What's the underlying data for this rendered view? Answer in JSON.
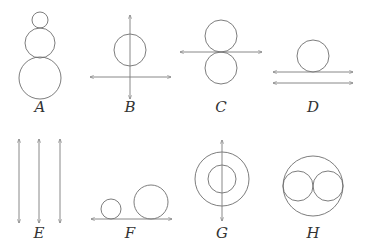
{
  "figures": [
    {
      "id": "A",
      "label": "A",
      "description": "three stacked tangent circles, increasing size downward",
      "circles": [
        {
          "cx": 40,
          "cy": 20,
          "r": 8
        },
        {
          "cx": 40,
          "cy": 43,
          "r": 15
        },
        {
          "cx": 40,
          "cy": 78,
          "r": 21
        }
      ],
      "lines": [],
      "label_pos": {
        "x": 40,
        "y": 112
      }
    },
    {
      "id": "B",
      "label": "B",
      "description": "circle pierced by vertical line, with horizontal line below",
      "circles": [
        {
          "cx": 130,
          "cy": 50,
          "r": 16
        }
      ],
      "lines": [
        {
          "x1": 130,
          "y1": 15,
          "x2": 130,
          "y2": 99
        },
        {
          "x1": 90,
          "y1": 77,
          "x2": 171,
          "y2": 77
        }
      ],
      "label_pos": {
        "x": 130,
        "y": 112
      }
    },
    {
      "id": "C",
      "label": "C",
      "description": "two equal circles tangent at a horizontal line",
      "circles": [
        {
          "cx": 221,
          "cy": 36,
          "r": 16
        },
        {
          "cx": 221,
          "cy": 68,
          "r": 16
        }
      ],
      "lines": [
        {
          "x1": 180,
          "y1": 52,
          "x2": 262,
          "y2": 52
        }
      ],
      "label_pos": {
        "x": 221,
        "y": 112
      }
    },
    {
      "id": "D",
      "label": "D",
      "description": "circle resting on one of two parallel horizontal lines",
      "circles": [
        {
          "cx": 313,
          "cy": 56,
          "r": 16
        }
      ],
      "lines": [
        {
          "x1": 273,
          "y1": 72,
          "x2": 353,
          "y2": 72
        },
        {
          "x1": 273,
          "y1": 83,
          "x2": 353,
          "y2": 83
        }
      ],
      "label_pos": {
        "x": 313,
        "y": 112
      }
    },
    {
      "id": "E",
      "label": "E",
      "description": "three parallel vertical lines",
      "circles": [],
      "lines": [
        {
          "x1": 19,
          "y1": 139,
          "x2": 19,
          "y2": 223
        },
        {
          "x1": 39,
          "y1": 139,
          "x2": 39,
          "y2": 223
        },
        {
          "x1": 60,
          "y1": 139,
          "x2": 60,
          "y2": 223
        }
      ],
      "label_pos": {
        "x": 39,
        "y": 238
      }
    },
    {
      "id": "F",
      "label": "F",
      "description": "small and large circles resting on a horizontal line",
      "circles": [
        {
          "cx": 111,
          "cy": 209,
          "r": 10
        },
        {
          "cx": 151,
          "cy": 202,
          "r": 17
        }
      ],
      "lines": [
        {
          "x1": 91,
          "y1": 219,
          "x2": 172,
          "y2": 219
        }
      ],
      "label_pos": {
        "x": 130,
        "y": 238
      }
    },
    {
      "id": "G",
      "label": "G",
      "description": "concentric circles with vertical line through center",
      "circles": [
        {
          "cx": 222,
          "cy": 179,
          "r": 27
        },
        {
          "cx": 222,
          "cy": 179,
          "r": 14
        }
      ],
      "lines": [
        {
          "x1": 222,
          "y1": 140,
          "x2": 222,
          "y2": 221
        }
      ],
      "label_pos": {
        "x": 222,
        "y": 238
      }
    },
    {
      "id": "H",
      "label": "H",
      "description": "large circle containing two tangent internal circles",
      "circles": [
        {
          "cx": 313,
          "cy": 186,
          "r": 30
        },
        {
          "cx": 298,
          "cy": 186,
          "r": 15
        },
        {
          "cx": 328,
          "cy": 186,
          "r": 15
        }
      ],
      "lines": [],
      "label_pos": {
        "x": 313,
        "y": 238
      }
    }
  ]
}
